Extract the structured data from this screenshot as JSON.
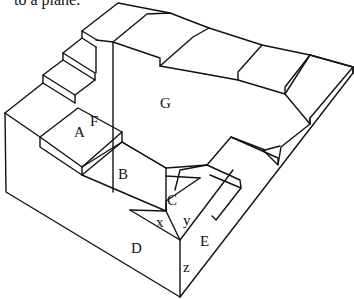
{
  "caption": "to a plane.",
  "figure": {
    "type": "impossible-staircase",
    "labels": {
      "A": "A",
      "B": "B",
      "C": "C",
      "D": "D",
      "E": "E",
      "F": "F",
      "G": "G",
      "x": "x",
      "y": "y",
      "z": "z"
    },
    "line_color": "#111111",
    "background": "#ffffff"
  }
}
